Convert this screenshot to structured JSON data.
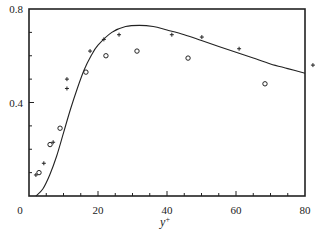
{
  "chart_data": {
    "type": "scatter",
    "title": "",
    "xlabel": "y",
    "xlabel_superscript": "+",
    "ylabel": "",
    "xlim": [
      0,
      80
    ],
    "ylim": [
      0,
      0.8
    ],
    "x_ticks": [
      0,
      20,
      40,
      60,
      80
    ],
    "x_tick_labels": [
      "0",
      "20",
      "40",
      "60",
      "80"
    ],
    "y_ticks": [
      0.4,
      0.8
    ],
    "y_tick_labels": [
      "0.4",
      "0.8"
    ],
    "y_minor_step": 0.1,
    "x_minor_step": 5,
    "origin_label": "0",
    "grid": false,
    "legend": "none",
    "series": [
      {
        "name": "curve",
        "kind": "line",
        "x": [
          2,
          4,
          6,
          8,
          10,
          12,
          14,
          16,
          18,
          20,
          24,
          28,
          32,
          36,
          40,
          45,
          50,
          55,
          60,
          65,
          70,
          75,
          80
        ],
        "y": [
          0.0,
          0.03,
          0.09,
          0.17,
          0.27,
          0.37,
          0.46,
          0.54,
          0.6,
          0.645,
          0.7,
          0.725,
          0.73,
          0.725,
          0.71,
          0.69,
          0.665,
          0.64,
          0.615,
          0.59,
          0.565,
          0.545,
          0.525
        ]
      },
      {
        "name": "plus",
        "kind": "marker-plus",
        "x": [
          2.0,
          4.3,
          7.0,
          11.0,
          11.0,
          17.7,
          21.7,
          26.1,
          41.4,
          50.1,
          60.9,
          82.3
        ],
        "y": [
          0.09,
          0.14,
          0.23,
          0.46,
          0.5,
          0.62,
          0.67,
          0.69,
          0.69,
          0.68,
          0.63,
          0.56
        ]
      },
      {
        "name": "circle",
        "kind": "marker-circle",
        "x": [
          2.9,
          6.1,
          9.0,
          16.5,
          22.3,
          31.3,
          46.1,
          68.4
        ],
        "y": [
          0.1,
          0.22,
          0.29,
          0.53,
          0.6,
          0.62,
          0.59,
          0.48
        ]
      }
    ],
    "colors": {
      "ink": "#222222"
    }
  }
}
